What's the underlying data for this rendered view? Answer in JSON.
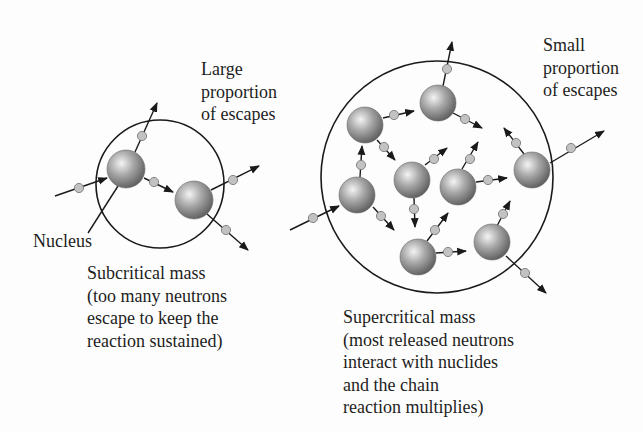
{
  "labels": {
    "large_escapes": [
      "Large",
      "proportion",
      "of escapes"
    ],
    "small_escapes": [
      "Small",
      "proportion",
      "of escapes"
    ],
    "nucleus": "Nucleus",
    "subcritical": [
      "Subcritical mass",
      "(too many neutrons",
      "escape to keep the",
      "reaction sustained)"
    ],
    "supercritical": [
      "Supercritical mass",
      "(most released neutrons",
      "interact with nuclides",
      "and the chain",
      "reaction multiplies)"
    ]
  },
  "colors": {
    "line": "#1a1a1a",
    "nucleus_light": "#f4f4f4",
    "nucleus_mid": "#a8a8a8",
    "nucleus_dark": "#5a5a5a",
    "neutron_fill": "#c2c2c2",
    "neutron_stroke": "#7a7a7a"
  },
  "subcritical_diagram": {
    "boundary": {
      "cx": 160,
      "cy": 184,
      "r": 64
    },
    "nuclei": [
      {
        "id": "A",
        "cx": 126,
        "cy": 169,
        "r": 19
      },
      {
        "id": "B",
        "cx": 194,
        "cy": 200,
        "r": 19
      }
    ],
    "neutron_paths": [
      {
        "x1": 55,
        "y1": 196,
        "x2": 107,
        "y2": 178,
        "nx": 79,
        "ny": 188,
        "arrow": true
      },
      {
        "x1": 135,
        "y1": 152,
        "x2": 157,
        "y2": 103,
        "nx": 142,
        "ny": 136,
        "arrow": true
      },
      {
        "x1": 144,
        "y1": 178,
        "x2": 173,
        "y2": 192,
        "nx": 154,
        "ny": 182,
        "arrow": true
      },
      {
        "x1": 211,
        "y1": 190,
        "x2": 259,
        "y2": 166,
        "nx": 233,
        "ny": 180,
        "arrow": true
      },
      {
        "x1": 207,
        "y1": 214,
        "x2": 248,
        "y2": 250,
        "nx": 226,
        "ny": 230,
        "arrow": true
      }
    ],
    "nucleus_pointer": {
      "x1": 118,
      "y1": 186,
      "x2": 88,
      "y2": 233
    }
  },
  "supercritical_diagram": {
    "boundary": {
      "cx": 437,
      "cy": 177,
      "r": 116
    },
    "nuclei": [
      {
        "id": "1",
        "cx": 438,
        "cy": 103,
        "r": 18
      },
      {
        "id": "2",
        "cx": 365,
        "cy": 125,
        "r": 18
      },
      {
        "id": "3",
        "cx": 357,
        "cy": 195,
        "r": 18
      },
      {
        "id": "4",
        "cx": 412,
        "cy": 180,
        "r": 18
      },
      {
        "id": "5",
        "cx": 458,
        "cy": 187,
        "r": 18
      },
      {
        "id": "6",
        "cx": 532,
        "cy": 170,
        "r": 18
      },
      {
        "id": "7",
        "cx": 418,
        "cy": 257,
        "r": 18
      },
      {
        "id": "8",
        "cx": 492,
        "cy": 242,
        "r": 18
      }
    ],
    "neutron_paths": [
      {
        "x1": 290,
        "y1": 230,
        "x2": 339,
        "y2": 206,
        "nx": 313,
        "ny": 218,
        "arrow": true
      },
      {
        "x1": 443,
        "y1": 86,
        "x2": 452,
        "y2": 42,
        "nx": 447,
        "ny": 69,
        "arrow": true
      },
      {
        "x1": 383,
        "y1": 118,
        "x2": 414,
        "y2": 111,
        "nx": 394,
        "ny": 115,
        "arrow": true
      },
      {
        "x1": 453,
        "y1": 113,
        "x2": 482,
        "y2": 128,
        "nx": 465,
        "ny": 119,
        "arrow": true
      },
      {
        "x1": 377,
        "y1": 140,
        "x2": 395,
        "y2": 160,
        "nx": 384,
        "ny": 147,
        "arrow": true
      },
      {
        "x1": 360,
        "y1": 177,
        "x2": 362,
        "y2": 146,
        "nx": 361,
        "ny": 165,
        "arrow": true
      },
      {
        "x1": 373,
        "y1": 207,
        "x2": 394,
        "y2": 230,
        "nx": 381,
        "ny": 216,
        "arrow": true
      },
      {
        "x1": 425,
        "y1": 165,
        "x2": 447,
        "y2": 148,
        "nx": 434,
        "ny": 159,
        "arrow": true
      },
      {
        "x1": 414,
        "y1": 198,
        "x2": 415,
        "y2": 227,
        "nx": 414,
        "ny": 209,
        "arrow": true
      },
      {
        "x1": 462,
        "y1": 169,
        "x2": 478,
        "y2": 142,
        "nx": 470,
        "ny": 159,
        "arrow": true
      },
      {
        "x1": 476,
        "y1": 182,
        "x2": 507,
        "y2": 178,
        "nx": 488,
        "ny": 180,
        "arrow": true
      },
      {
        "x1": 524,
        "y1": 154,
        "x2": 504,
        "y2": 128,
        "nx": 516,
        "ny": 143,
        "arrow": true
      },
      {
        "x1": 550,
        "y1": 163,
        "x2": 604,
        "y2": 131,
        "nx": 571,
        "ny": 148,
        "arrow": true
      },
      {
        "x1": 427,
        "y1": 241,
        "x2": 448,
        "y2": 213,
        "nx": 435,
        "ny": 230,
        "arrow": true
      },
      {
        "x1": 436,
        "y1": 253,
        "x2": 466,
        "y2": 251,
        "nx": 448,
        "ny": 252,
        "arrow": true
      },
      {
        "x1": 497,
        "y1": 226,
        "x2": 510,
        "y2": 201,
        "nx": 503,
        "ny": 214,
        "arrow": true
      },
      {
        "x1": 506,
        "y1": 256,
        "x2": 546,
        "y2": 293,
        "nx": 525,
        "ny": 273,
        "arrow": true
      }
    ]
  }
}
